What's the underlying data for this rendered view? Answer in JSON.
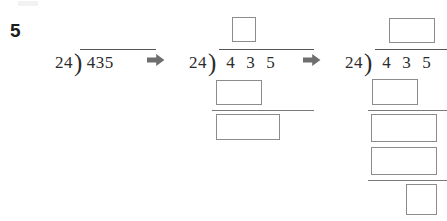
{
  "page": {
    "artifact_note": "",
    "problem_number": "5"
  },
  "icons": {
    "arrow_right": "arrow-right-icon"
  },
  "problem": {
    "divisor": "24",
    "dividend": "435",
    "dividend_digits": [
      "4",
      "3",
      "5"
    ],
    "bracket_glyph": ")"
  },
  "stages": [
    {
      "id": "stage-1",
      "label": "initial-setup",
      "divisor": "24",
      "dividend": "435",
      "boxes": []
    },
    {
      "id": "stage-2",
      "label": "first-partial-quotient",
      "divisor": "24",
      "dividend_digits": [
        "4",
        "3",
        "5"
      ],
      "boxes": [
        {
          "name": "quotient-box-1",
          "value": ""
        },
        {
          "name": "product-box-1",
          "value": ""
        },
        {
          "name": "remainder-box-1",
          "value": ""
        }
      ]
    },
    {
      "id": "stage-3",
      "label": "second-partial-quotient",
      "divisor": "24",
      "dividend_digits": [
        "4",
        "3",
        "5"
      ],
      "boxes": [
        {
          "name": "quotient-box-1",
          "value": ""
        },
        {
          "name": "product-box-1",
          "value": ""
        },
        {
          "name": "remainder-box-1",
          "value": ""
        },
        {
          "name": "product-box-2",
          "value": ""
        },
        {
          "name": "remainder-box-2",
          "value": ""
        }
      ]
    }
  ],
  "colors": {
    "ink": "#2b2b2b",
    "box_border": "#8c8c8c",
    "rule": "#7a7a7a",
    "arrow": "#6e6e6e",
    "background": "#ffffff"
  }
}
